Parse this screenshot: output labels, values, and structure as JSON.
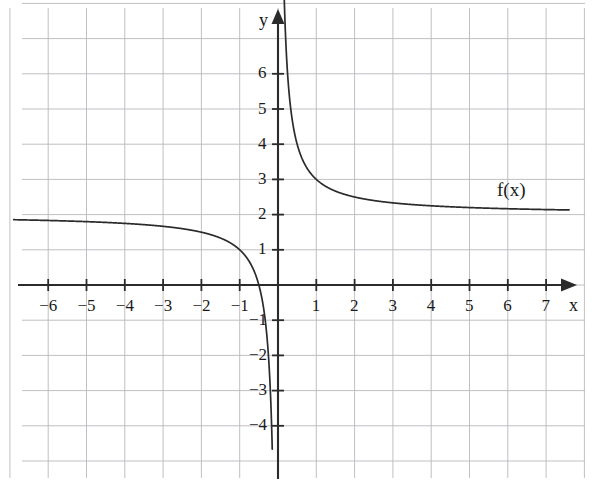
{
  "figure": {
    "background_color": "#ffffff",
    "grid_color": "#b9b9bd",
    "axis_color": "#2b2b2b",
    "curve_color": "#2b2b2b",
    "width": 593,
    "height": 482
  },
  "chart_data": {
    "type": "line",
    "title": "",
    "subtitle": "",
    "xlabel": "x",
    "ylabel": "y",
    "xlim": [
      -6.9,
      7.6
    ],
    "ylim": [
      -4.8,
      6.9
    ],
    "grid": true,
    "grid_spacing": {
      "x": 1,
      "y": 1
    },
    "legend": {
      "position": "inline-right",
      "entries": [
        "f(x)"
      ]
    },
    "annotations": [
      {
        "text": "f(x)",
        "x": 6.0,
        "y": 2.55
      }
    ],
    "x_ticks": [
      -6,
      -5,
      -4,
      -3,
      -2,
      -1,
      1,
      2,
      3,
      4,
      5,
      6,
      7
    ],
    "x_tick_labels": [
      "−6",
      "−5",
      "−4",
      "−3",
      "−2",
      "−1",
      "1",
      "2",
      "3",
      "4",
      "5",
      "6",
      "7"
    ],
    "y_ticks": [
      -4,
      -3,
      -2,
      -1,
      1,
      2,
      3,
      4,
      5,
      6
    ],
    "y_tick_labels": [
      "−4",
      "−3",
      "−2",
      "−1",
      "1",
      "2",
      "3",
      "4",
      "5",
      "6"
    ],
    "series": [
      {
        "name": "f(x)",
        "expression": "2 + 1/x",
        "horizontal_asymptote": 2,
        "vertical_asymptote": 0,
        "x_intercept": -0.5,
        "branches": [
          {
            "name": "left-branch",
            "domain": [
              -6.9,
              -0.15
            ],
            "points": [
              {
                "x": -6.9,
                "y": 1.855
              },
              {
                "x": -6.0,
                "y": 1.833
              },
              {
                "x": -5.0,
                "y": 1.8
              },
              {
                "x": -4.0,
                "y": 1.75
              },
              {
                "x": -3.0,
                "y": 1.667
              },
              {
                "x": -2.5,
                "y": 1.6
              },
              {
                "x": -2.0,
                "y": 1.5
              },
              {
                "x": -1.5,
                "y": 1.333
              },
              {
                "x": -1.25,
                "y": 1.2
              },
              {
                "x": -1.0,
                "y": 1.0
              },
              {
                "x": -0.8,
                "y": 0.75
              },
              {
                "x": -0.6,
                "y": 0.333
              },
              {
                "x": -0.5,
                "y": 0.0
              },
              {
                "x": -0.4,
                "y": -0.5
              },
              {
                "x": -0.3,
                "y": -1.333
              },
              {
                "x": -0.25,
                "y": -2.0
              },
              {
                "x": -0.2,
                "y": -3.0
              },
              {
                "x": -0.17,
                "y": -3.882
              },
              {
                "x": -0.15,
                "y": -4.667
              }
            ]
          },
          {
            "name": "right-branch",
            "domain": [
              0.15,
              7.6
            ],
            "points": [
              {
                "x": 0.15,
                "y": 8.667
              },
              {
                "x": 0.2,
                "y": 7.0
              },
              {
                "x": 0.25,
                "y": 6.0
              },
              {
                "x": 0.3,
                "y": 5.333
              },
              {
                "x": 0.4,
                "y": 4.5
              },
              {
                "x": 0.5,
                "y": 4.0
              },
              {
                "x": 0.6,
                "y": 3.667
              },
              {
                "x": 0.8,
                "y": 3.25
              },
              {
                "x": 1.0,
                "y": 3.0
              },
              {
                "x": 1.5,
                "y": 2.667
              },
              {
                "x": 2.0,
                "y": 2.5
              },
              {
                "x": 3.0,
                "y": 2.333
              },
              {
                "x": 4.0,
                "y": 2.25
              },
              {
                "x": 5.0,
                "y": 2.2
              },
              {
                "x": 6.0,
                "y": 2.167
              },
              {
                "x": 7.0,
                "y": 2.143
              },
              {
                "x": 7.6,
                "y": 2.132
              }
            ]
          }
        ]
      }
    ]
  }
}
